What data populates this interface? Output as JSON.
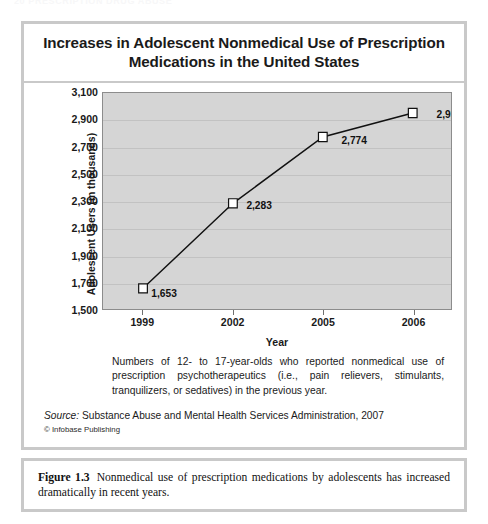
{
  "running_head": "20   PRESCRIPTION DRUG ABUSE",
  "chart": {
    "title_line1": "Increases in Adolescent Nonmedical Use of Prescription",
    "title_line2": "Medications in the United States",
    "y_axis_title": "Adolescent Users (in thousands)",
    "x_axis_title": "Year",
    "note": "Numbers of 12- to 17-year-olds who reported nonmedical use of prescription psychotherapeutics (i.e., pain relievers, stimulants, tranquilizers, or sedatives) in the previous year.",
    "source_label": "Source:",
    "source_text": "Substance Abuse and Mental Health Services Administration, 2007",
    "copyright": "© Infobase Publishing"
  },
  "figure_caption": {
    "number": "Figure 1.3",
    "text": "Nonmedical use of prescription medications by adolescents has increased dramatically in recent years."
  },
  "colors": {
    "plot_background": "#d5d5d5",
    "gridline": "#c2c2c2",
    "series_line": "#111111",
    "marker_fill": "#ffffff",
    "frame_border": "#c9c9c9",
    "page_background": "#ffffff"
  },
  "chart_data": {
    "type": "line",
    "title": "Increases in Adolescent Nonmedical Use of Prescription Medications in the United States",
    "xlabel": "Year",
    "ylabel": "Adolescent Users (in thousands)",
    "categories": [
      "1999",
      "2002",
      "2005",
      "2006"
    ],
    "values": [
      1653,
      2283,
      2774,
      2952
    ],
    "point_labels": [
      "1,653",
      "2,283",
      "2,774",
      "2,952"
    ],
    "ylim": [
      1500,
      3100
    ],
    "yticks": [
      3100,
      2900,
      2700,
      2500,
      2300,
      2100,
      1900,
      1700,
      1500
    ],
    "ytick_labels": [
      "3,100",
      "2,900",
      "2,700",
      "2,500",
      "2,300",
      "2,100",
      "1,900",
      "1,700",
      "1,500"
    ],
    "grid": true,
    "legend": "none",
    "marker": "open-square",
    "series": [
      {
        "name": "Adolescent nonmedical users",
        "values": [
          1653,
          2283,
          2774,
          2952
        ]
      }
    ]
  }
}
